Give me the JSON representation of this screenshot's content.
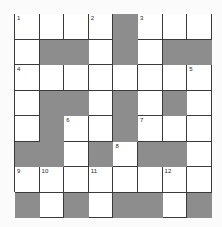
{
  "puzzle": {
    "type": "crossword",
    "rows": 8,
    "cols": 8,
    "colors": {
      "black_cell": "#8d8d8d",
      "white_cell": "#ffffff",
      "grid_line": "#3a3a3a"
    },
    "grid": [
      [
        "1",
        "",
        "",
        "2",
        "#",
        "3",
        "",
        ""
      ],
      [
        "",
        "#",
        "#",
        "",
        "#",
        "",
        "#",
        "#"
      ],
      [
        "4",
        "",
        "",
        "",
        "",
        "",
        "",
        "5"
      ],
      [
        "",
        "#",
        "#",
        "",
        "#",
        "",
        "#",
        ""
      ],
      [
        "",
        "#",
        "6",
        "",
        "#",
        "7",
        "",
        ""
      ],
      [
        "#",
        "#",
        "",
        "#",
        "8",
        "#",
        "#",
        ""
      ],
      [
        "9",
        "10",
        "",
        "11",
        "",
        "",
        "12",
        ""
      ],
      [
        "#",
        "",
        "#",
        "",
        "#",
        "#",
        "",
        "#"
      ]
    ]
  }
}
